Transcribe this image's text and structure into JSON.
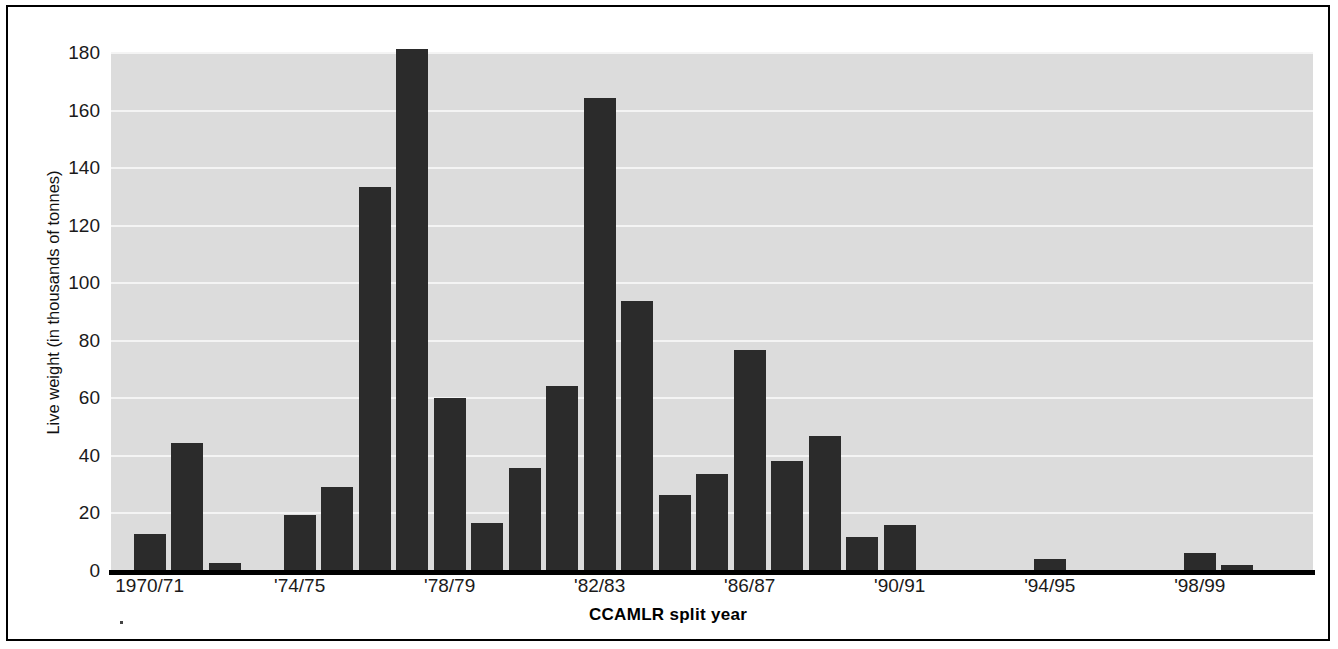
{
  "chart_data": {
    "type": "bar",
    "title": "",
    "xlabel": "CCAMLR split year",
    "ylabel": "Live weight (in thousands of tonnes)",
    "ylim": [
      0,
      180
    ],
    "yticks": [
      180,
      160,
      140,
      120,
      100,
      80,
      60,
      40,
      20,
      0
    ],
    "grid": "horizontal",
    "legend": "none",
    "bar_color": "#2b2b2b",
    "plot_background": "#dcdcdc",
    "categories": [
      "1970/71",
      "'71/72",
      "'72/73",
      "'73/74",
      "'74/75",
      "'75/76",
      "'76/77",
      "'77/78",
      "'78/79",
      "'79/80",
      "'80/81",
      "'81/82",
      "'82/83",
      "'83/84",
      "'84/85",
      "'85/86",
      "'86/87",
      "'87/88",
      "'88/89",
      "'89/90",
      "'90/91",
      "'91/92",
      "'92/93",
      "'93/94",
      "'94/95",
      "'95/96",
      "'96/97",
      "'97/98",
      "'98/99",
      "'99/00"
    ],
    "values": [
      12.4,
      44.0,
      2.5,
      0.0,
      19.0,
      28.8,
      133.0,
      181.0,
      59.8,
      16.2,
      35.6,
      63.8,
      164.0,
      93.5,
      26.0,
      33.5,
      76.5,
      37.8,
      46.5,
      11.5,
      15.6,
      0.0,
      0.0,
      0.0,
      4.0,
      0.0,
      0.0,
      0.0,
      6.0,
      1.8
    ],
    "xtick_labels": [
      "1970/71",
      "'74/75",
      "'78/79",
      "'82/83",
      "'86/87",
      "'90/91",
      "'94/95",
      "'98/99"
    ],
    "xtick_indices": [
      0,
      4,
      8,
      12,
      16,
      20,
      24,
      28
    ]
  }
}
